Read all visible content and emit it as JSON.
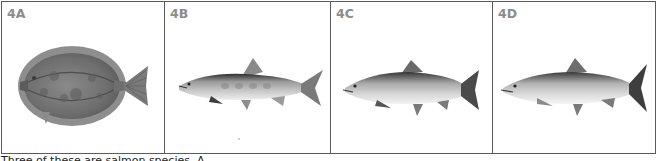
{
  "figure": {
    "panels": [
      {
        "id": "4A",
        "label": "4A",
        "subject": "flatfish-illustration"
      },
      {
        "id": "4B",
        "label": "4B",
        "subject": "salmon-illustration"
      },
      {
        "id": "4C",
        "label": "4C",
        "subject": "salmon-illustration"
      },
      {
        "id": "4D",
        "label": "4D",
        "subject": "salmon-illustration"
      }
    ],
    "border_color": "#5a5a5a",
    "label_color": "#8c8c8c"
  },
  "caption": {
    "text": "Three of these are salmon species. A..."
  }
}
